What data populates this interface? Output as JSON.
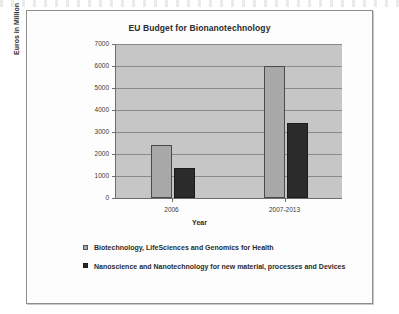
{
  "chart_data": {
    "type": "bar",
    "title": "EU Budget for Bionanotechnology",
    "xlabel": "Year",
    "ylabel": "Euros in Million",
    "categories": [
      "2006",
      "2007-2013"
    ],
    "series": [
      {
        "name": "Biotechnology, LifeSciences and Genomics for Health",
        "color": "#a8a8a8",
        "values": [
          2400,
          6000
        ]
      },
      {
        "name": "Nanoscience and Nanotechnology for new material, processes and Devices",
        "color": "#2b2b2b",
        "values": [
          1350,
          3400
        ]
      }
    ],
    "ylim": [
      0,
      7000
    ],
    "yticks": [
      "0",
      "1000",
      "2000",
      "3000",
      "4000",
      "5000",
      "6000",
      "7000"
    ],
    "grid": true,
    "legend_position": "bottom"
  }
}
